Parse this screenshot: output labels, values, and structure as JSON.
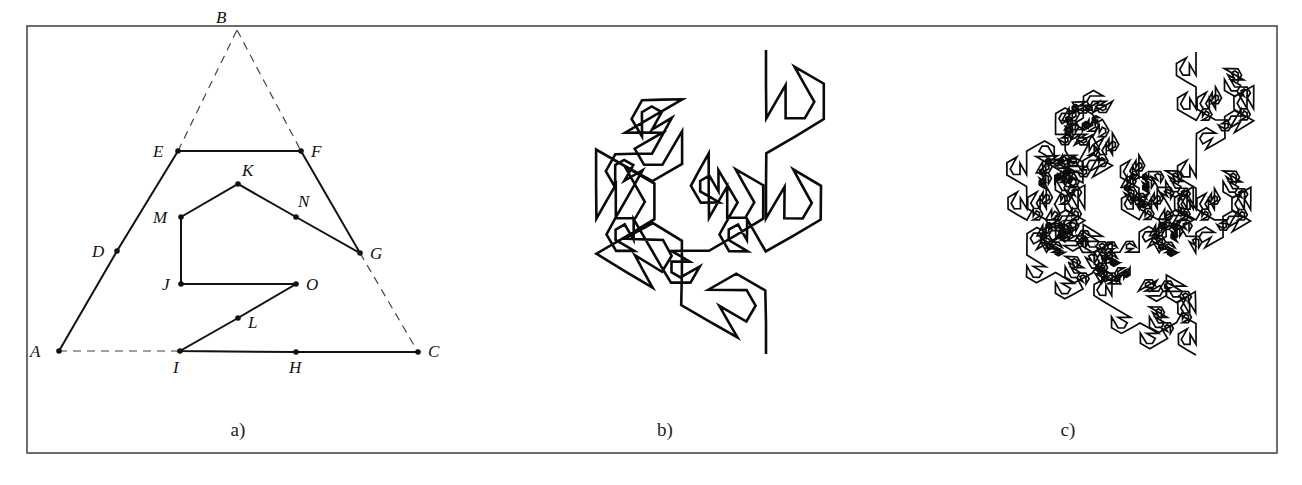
{
  "figure": {
    "frame": {
      "x": 27,
      "y": 26,
      "width": 1250,
      "height": 427
    },
    "panels": [
      {
        "id": "a",
        "label": "a)",
        "label_pos": [
          238,
          436
        ]
      },
      {
        "id": "b",
        "label": "b)",
        "label_pos": [
          665,
          436
        ]
      },
      {
        "id": "c",
        "label": "c)",
        "label_pos": [
          1068,
          436
        ]
      }
    ]
  },
  "chart_data": {
    "type": "diagram",
    "panel_a": {
      "points": {
        "A": [
          59,
          351
        ],
        "B": [
          237,
          30
        ],
        "C": [
          418,
          352
        ],
        "D": [
          117,
          251
        ],
        "E": [
          178,
          151
        ],
        "F": [
          301,
          151
        ],
        "G": [
          360,
          253
        ],
        "N": [
          296,
          217
        ],
        "K": [
          238,
          184
        ],
        "M": [
          181,
          217
        ],
        "J": [
          181,
          284
        ],
        "O": [
          296,
          284
        ],
        "L": [
          238,
          318
        ],
        "I": [
          180,
          351
        ],
        "H": [
          296,
          352
        ]
      },
      "labels": [
        {
          "name": "A",
          "x": 30,
          "y": 357
        },
        {
          "name": "B",
          "x": 216,
          "y": 23
        },
        {
          "name": "C",
          "x": 428,
          "y": 357
        },
        {
          "name": "D",
          "x": 92,
          "y": 257
        },
        {
          "name": "E",
          "x": 153,
          "y": 157
        },
        {
          "name": "F",
          "x": 311,
          "y": 157
        },
        {
          "name": "G",
          "x": 370,
          "y": 259
        },
        {
          "name": "N",
          "x": 298,
          "y": 207
        },
        {
          "name": "K",
          "x": 242,
          "y": 176
        },
        {
          "name": "M",
          "x": 153,
          "y": 223
        },
        {
          "name": "J",
          "x": 162,
          "y": 290
        },
        {
          "name": "O",
          "x": 306,
          "y": 290
        },
        {
          "name": "L",
          "x": 248,
          "y": 328
        },
        {
          "name": "I",
          "x": 173,
          "y": 373
        },
        {
          "name": "H",
          "x": 289,
          "y": 373
        }
      ],
      "generator_path": [
        "A",
        "D",
        "E",
        "F",
        "G",
        "N",
        "K",
        "M",
        "J",
        "O",
        "L",
        "I",
        "H",
        "C"
      ],
      "dashed_segments": [
        [
          "A",
          "I"
        ],
        [
          "E",
          "B"
        ],
        [
          "B",
          "F"
        ],
        [
          "G",
          "C"
        ]
      ],
      "dots": [
        "A",
        "D",
        "E",
        "F",
        "G",
        "N",
        "K",
        "M",
        "J",
        "O",
        "L",
        "I",
        "H",
        "C"
      ]
    },
    "panel_b": {
      "iteration": 2,
      "start": [
        766,
        354
      ],
      "end": [
        766,
        50
      ],
      "stroke_width": 2.6
    },
    "panel_c": {
      "iteration": 3,
      "start": [
        1196,
        355
      ],
      "end": [
        1196,
        52
      ],
      "stroke_width": 1.7
    }
  }
}
